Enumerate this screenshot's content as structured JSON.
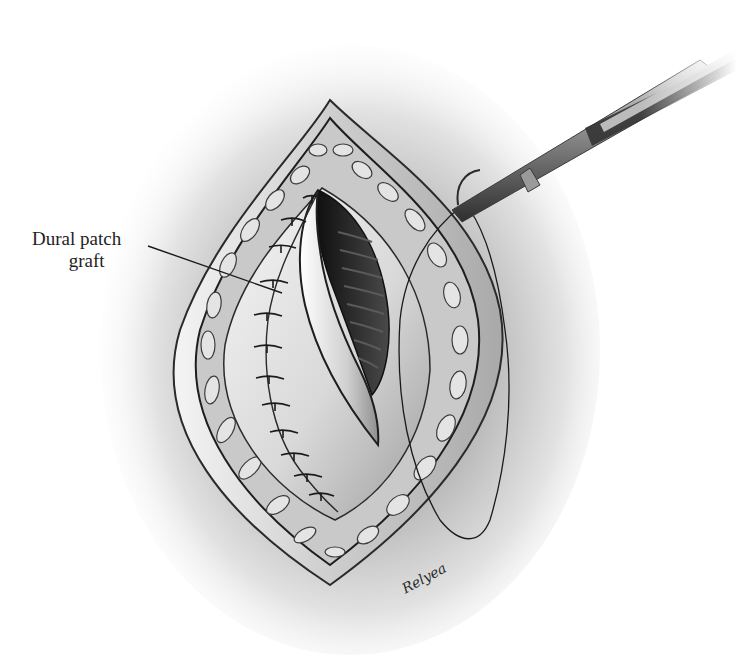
{
  "illustration": {
    "subject": "Surgical opening with dural patch graft sutured in place, needle holder passing suture",
    "palette": {
      "background": "#ffffff",
      "skin_shadow": "#7a7a7a",
      "tissue_light": "#e6e6e6",
      "tissue_mid": "#bdbdbd",
      "dark_cavity": "#1a1a1a",
      "ink": "#1e1e1e",
      "instrument_dark": "#3a3a3a",
      "instrument_light": "#c9c9c9"
    },
    "label": {
      "line1": "Dural patch",
      "line2": "graft"
    },
    "signature": "Relyea"
  }
}
